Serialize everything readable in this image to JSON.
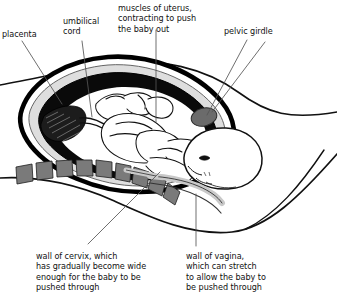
{
  "diagram": {
    "labels": [
      {
        "id": "placenta",
        "text": "placenta"
      },
      {
        "id": "umbilical",
        "text": "umbilical\ncord"
      },
      {
        "id": "muscles",
        "text": "muscles of uterus,\ncontracting to push\nthe baby out"
      },
      {
        "id": "pelvic",
        "text": "pelvic girdle"
      },
      {
        "id": "cervix",
        "text": "wall of cervix, which\nhas gradually become wide\nenough for the baby to be\npushed through"
      },
      {
        "id": "vagina",
        "text": "wall of vagina,\nwhich can stretch\nto allow the baby to\nbe pushed through"
      }
    ],
    "colors": {
      "ink": "#111111",
      "outline": "#000000",
      "uterus_wall_gray": "#d9d9d9",
      "amniotic_black": "#000000",
      "vertebrae_gray": "#7a7a7a",
      "pelvic_girdle_gray": "#6b6b6b",
      "vagina_wall_gray": "#cfcfcf",
      "background": "#ffffff",
      "leader_line": "#555555"
    }
  }
}
